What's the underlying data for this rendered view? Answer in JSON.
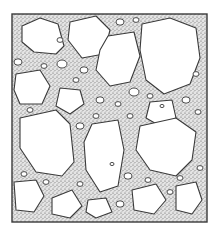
{
  "figure": {
    "frame": {
      "x": 12,
      "y": 14,
      "w": 195,
      "h": 208
    },
    "colors": {
      "background": "#ffffff",
      "ink": "#3a3a3a",
      "matrix": "#c9c9c9",
      "stone": "#ffffff"
    },
    "large_stones": [
      {
        "points": "22,26 40,18 58,24 64,46 56,54 34,52 22,42"
      },
      {
        "points": "70,22 96,16 110,30 104,54 82,58 68,40"
      },
      {
        "points": "142,24 170,18 196,28 200,58 190,84 164,94 146,80 140,50"
      },
      {
        "points": "108,36 134,32 140,56 130,82 110,86 96,70 100,50"
      },
      {
        "points": "16,74 40,70 50,86 42,104 20,104 14,90"
      },
      {
        "points": "60,88 80,90 84,104 70,114 56,106"
      },
      {
        "points": "150,102 172,100 176,118 160,126 146,118"
      },
      {
        "points": "20,118 56,110 70,124 74,162 62,176 36,172 20,148"
      },
      {
        "points": "92,124 118,120 124,150 118,186 100,192 86,170 84,142"
      },
      {
        "points": "140,126 176,118 196,132 192,160 176,176 150,170 136,150"
      },
      {
        "points": "14,182 36,180 44,196 34,212 16,210"
      },
      {
        "points": "52,198 72,190 82,206 70,218 52,214"
      },
      {
        "points": "132,190 156,184 166,200 154,214 134,210"
      },
      {
        "points": "176,186 196,182 202,200 192,214 176,210"
      },
      {
        "points": "88,200 106,198 112,212 96,218 86,212"
      }
    ],
    "small_stones": [
      {
        "cx": 18,
        "cy": 62,
        "r": 4
      },
      {
        "cx": 62,
        "cy": 64,
        "r": 5
      },
      {
        "cx": 84,
        "cy": 70,
        "r": 4
      },
      {
        "cx": 134,
        "cy": 92,
        "r": 5
      },
      {
        "cx": 100,
        "cy": 100,
        "r": 4
      },
      {
        "cx": 118,
        "cy": 104,
        "r": 3
      },
      {
        "cx": 186,
        "cy": 100,
        "r": 4
      },
      {
        "cx": 198,
        "cy": 112,
        "r": 3
      },
      {
        "cx": 80,
        "cy": 126,
        "r": 4
      },
      {
        "cx": 130,
        "cy": 116,
        "r": 3
      },
      {
        "cx": 128,
        "cy": 176,
        "r": 4
      },
      {
        "cx": 80,
        "cy": 184,
        "r": 3
      },
      {
        "cx": 46,
        "cy": 182,
        "r": 3
      },
      {
        "cx": 170,
        "cy": 192,
        "r": 3
      },
      {
        "cx": 120,
        "cy": 204,
        "r": 4
      },
      {
        "cx": 60,
        "cy": 40,
        "r": 3
      },
      {
        "cx": 120,
        "cy": 22,
        "r": 4
      },
      {
        "cx": 136,
        "cy": 20,
        "r": 3
      },
      {
        "cx": 30,
        "cy": 110,
        "r": 3
      },
      {
        "cx": 200,
        "cy": 168,
        "r": 3
      },
      {
        "cx": 196,
        "cy": 74,
        "r": 3
      },
      {
        "cx": 76,
        "cy": 80,
        "r": 3
      },
      {
        "cx": 112,
        "cy": 164,
        "r": 2
      },
      {
        "cx": 162,
        "cy": 106,
        "r": 2
      },
      {
        "cx": 44,
        "cy": 66,
        "r": 3
      },
      {
        "cx": 150,
        "cy": 96,
        "r": 3
      },
      {
        "cx": 24,
        "cy": 174,
        "r": 3
      },
      {
        "cx": 180,
        "cy": 178,
        "r": 3
      },
      {
        "cx": 148,
        "cy": 180,
        "r": 3
      },
      {
        "cx": 96,
        "cy": 116,
        "r": 3
      }
    ]
  }
}
